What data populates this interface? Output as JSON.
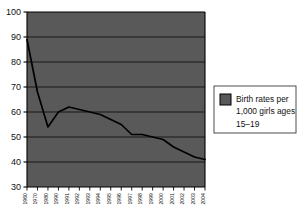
{
  "chart_data": {
    "type": "line",
    "title": "",
    "subtitle": "",
    "xlabel": "",
    "ylabel": "",
    "ylim": [
      30,
      100
    ],
    "yticks": [
      30,
      40,
      50,
      60,
      70,
      80,
      90,
      100
    ],
    "ytick_labels": [
      "30",
      "40",
      "50",
      "60",
      "70",
      "80",
      "90",
      "100"
    ],
    "grid": true,
    "grid_orientation": "horizontal",
    "legend_position": "right-outside",
    "plot_background": "#595959",
    "line_color": "#000000",
    "categories": [
      "1960",
      "1970",
      "1980",
      "1990",
      "1991",
      "1992",
      "1993",
      "1994",
      "1995",
      "1996",
      "1997",
      "1998",
      "1999",
      "2000",
      "2001",
      "2002",
      "2003",
      "2004"
    ],
    "series": [
      {
        "name": "Birth rates per 1,000 girls ages 15–19",
        "values": [
          89,
          68,
          54,
          60,
          62,
          61,
          60,
          59,
          57,
          55,
          51,
          51,
          50,
          49,
          46,
          44,
          42,
          41
        ]
      }
    ],
    "legend_entries": [
      {
        "swatch_color": "#595959",
        "label_line_1": "Birth rates per",
        "label_line_2": "1,000 girls ages",
        "label_line_3": "15–19"
      }
    ]
  },
  "colors": {
    "plot_fill": "#595959",
    "gridline": "#111111",
    "axis": "#000000",
    "data_line": "#000000",
    "legend_border": "#3a3a3a",
    "legend_swatch": "#595959",
    "text": "#111111",
    "page_background": "#ffffff"
  }
}
